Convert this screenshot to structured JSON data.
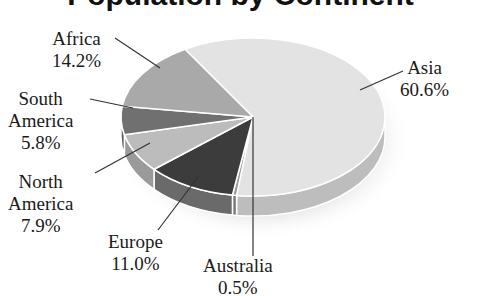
{
  "chart_data": {
    "type": "pie",
    "title": "Population by Continent",
    "title_visible": "partially clipped at top edge",
    "style": "3d-pie",
    "slices": [
      {
        "label": "Asia",
        "value": 60.6,
        "label_text": "60.6%",
        "color": "#e3e3e3",
        "side": "#bdbdbd"
      },
      {
        "label": "Australia",
        "value": 0.5,
        "label_text": "0.5%",
        "color": "#9a9a9a",
        "side": "#777777"
      },
      {
        "label": "Europe",
        "value": 11.0,
        "label_text": "11.0%",
        "color": "#3c3c3c",
        "side": "#6a6a6a"
      },
      {
        "label": "North America",
        "value": 7.9,
        "label_text": "7.9%",
        "color": "#bcbcbc",
        "side": "#9a9a9a"
      },
      {
        "label": "South America",
        "value": 5.8,
        "label_text": "5.8%",
        "color": "#707070",
        "side": "#5a5a5a"
      },
      {
        "label": "Africa",
        "value": 14.2,
        "label_text": "14.2%",
        "color": "#a9a9a9",
        "side": "#8a8a8a"
      }
    ],
    "units": "percent",
    "legend": "none (direct labels with leader lines)"
  },
  "labels": {
    "africa": {
      "name": "Africa",
      "value": "14.2%"
    },
    "asia": {
      "name": "Asia",
      "value": "60.6%"
    },
    "south_america": {
      "name1": "South",
      "name2": "America",
      "value": "5.8%"
    },
    "north_america": {
      "name1": "North",
      "name2": "America",
      "value": "7.9%"
    },
    "europe": {
      "name": "Europe",
      "value": "11.0%"
    },
    "australia": {
      "name": "Australia",
      "value": "0.5%"
    }
  },
  "title": "Population by Continent"
}
